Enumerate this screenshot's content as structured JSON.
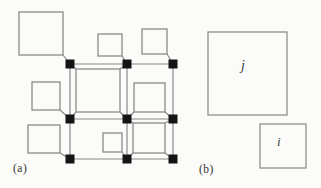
{
  "figure": {
    "type": "lattice-squares-diagram",
    "background": "#fbfbf9",
    "panel_a": {
      "label": "(a)",
      "lattice": {
        "columns_x": [
          70,
          127,
          173
        ],
        "rows_y": [
          64,
          119,
          159
        ],
        "node_size": 9,
        "node_count": 9,
        "node_color": "#141414",
        "edge_color": "#8a8a8a",
        "edge_width": 1.2
      },
      "square_stroke": "#858585",
      "square_stroke_width": 1.25,
      "squares": [
        {
          "x": 19,
          "y": 12,
          "w": 44,
          "h": 43,
          "links": [
            [
              63,
              55,
              70,
              64
            ]
          ]
        },
        {
          "x": 98,
          "y": 34,
          "w": 24,
          "h": 22,
          "links": [
            [
              122,
              56,
              127,
              64
            ]
          ]
        },
        {
          "x": 142,
          "y": 29,
          "w": 25,
          "h": 25,
          "links": [
            [
              167,
              54,
              173,
              64
            ]
          ]
        },
        {
          "x": 32,
          "y": 82,
          "w": 28,
          "h": 28,
          "links": [
            [
              60,
              110,
              70,
              119
            ]
          ]
        },
        {
          "x": 76,
          "y": 69,
          "w": 44,
          "h": 43,
          "links": [
            [
              76,
              69,
              70,
              64
            ],
            [
              120,
              69,
              127,
              64
            ],
            [
              76,
              112,
              70,
              119
            ],
            [
              120,
              112,
              127,
              119
            ]
          ]
        },
        {
          "x": 134,
          "y": 83,
          "w": 31,
          "h": 29,
          "links": [
            [
              134,
              112,
              127,
              119
            ],
            [
              165,
              112,
              173,
              119
            ]
          ]
        },
        {
          "x": 28,
          "y": 125,
          "w": 32,
          "h": 28,
          "links": [
            [
              60,
              153,
              70,
              159
            ]
          ]
        },
        {
          "x": 103,
          "y": 133,
          "w": 19,
          "h": 19,
          "links": [
            [
              122,
              152,
              127,
              159
            ]
          ]
        },
        {
          "x": 133,
          "y": 123,
          "w": 32,
          "h": 30,
          "links": [
            [
              133,
              123,
              127,
              119
            ],
            [
              165,
              123,
              173,
              119
            ],
            [
              133,
              153,
              127,
              159
            ],
            [
              165,
              153,
              173,
              159
            ]
          ]
        }
      ]
    },
    "panel_b": {
      "label": "(b)",
      "square_stroke": "#8f8f8f",
      "square_stroke_width": 1.3,
      "label_color": "#3c3c3c",
      "squares": [
        {
          "name": "square-j",
          "label": "j",
          "x": 208,
          "y": 32,
          "w": 79,
          "h": 83
        },
        {
          "name": "square-i",
          "label": "i",
          "x": 260,
          "y": 124,
          "w": 46,
          "h": 44
        }
      ]
    }
  }
}
